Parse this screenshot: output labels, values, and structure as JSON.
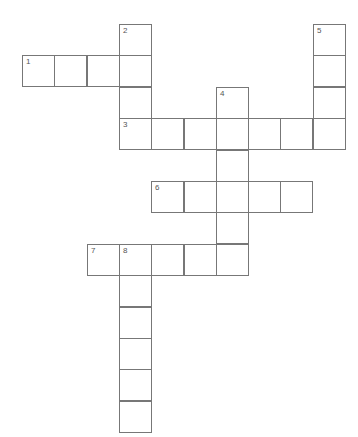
{
  "puzzle": {
    "type": "crossword",
    "grid_cols": 10,
    "grid_rows": 13,
    "origin": {
      "x": 22,
      "y": 24
    },
    "cell_size": {
      "w": 32.3,
      "h": 31.4
    },
    "border_color": "#777777",
    "entries": [
      {
        "number": "1",
        "direction": "across",
        "col": 0,
        "row": 1,
        "length": 4
      },
      {
        "number": "2",
        "direction": "down",
        "col": 3,
        "row": 0,
        "length": 4
      },
      {
        "number": "3",
        "direction": "across",
        "col": 3,
        "row": 3,
        "length": 7
      },
      {
        "number": "4",
        "direction": "down",
        "col": 6,
        "row": 2,
        "length": 6
      },
      {
        "number": "5",
        "direction": "down",
        "col": 9,
        "row": 0,
        "length": 4
      },
      {
        "number": "6",
        "direction": "across",
        "col": 4,
        "row": 5,
        "length": 5
      },
      {
        "number": "7",
        "direction": "across",
        "col": 2,
        "row": 7,
        "length": 5
      },
      {
        "number": "8",
        "direction": "down",
        "col": 3,
        "row": 7,
        "length": 6
      }
    ]
  }
}
